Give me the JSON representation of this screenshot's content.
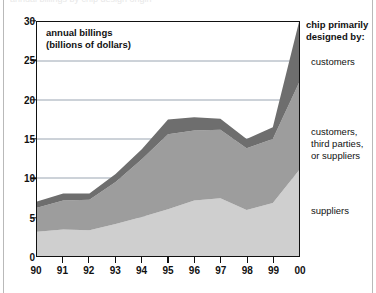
{
  "figure": {
    "clipped_title": "annual billings by chip design origin",
    "axis_caption_line1": "annual billings",
    "axis_caption_line2": "(billions of dollars)"
  },
  "legend": {
    "title_line1": "chip primarily",
    "title_line2": "designed by:",
    "entries": [
      {
        "key": "customers",
        "label": "customers",
        "color": "#6e6e6e"
      },
      {
        "key": "mixed",
        "label_line1": "customers,",
        "label_line2": "third parties,",
        "label_line3": "or suppliers",
        "color": "#9d9d9d"
      },
      {
        "key": "suppliers",
        "label": "suppliers",
        "color": "#cfcfcf"
      }
    ]
  },
  "chart_data": {
    "type": "area",
    "stacked": true,
    "title": "",
    "xlabel": "",
    "ylabel": "annual billings (billions of dollars)",
    "x": [
      "90",
      "91",
      "92",
      "93",
      "94",
      "95",
      "96",
      "97",
      "98",
      "99",
      "00"
    ],
    "xlim": [
      0,
      10
    ],
    "ylim": [
      0,
      30
    ],
    "yticks": [
      0,
      5,
      10,
      15,
      20,
      25,
      30
    ],
    "xticks": [
      "90",
      "91",
      "92",
      "93",
      "94",
      "95",
      "96",
      "97",
      "98",
      "99",
      "00"
    ],
    "grid": "horizontal",
    "legend_position": "right",
    "series": [
      {
        "name": "suppliers",
        "color": "#cfcfcf",
        "values": [
          3.1,
          3.4,
          3.3,
          4.1,
          5.0,
          6.0,
          7.1,
          7.4,
          5.9,
          6.8,
          11.0
        ]
      },
      {
        "name": "customers, third parties, or suppliers",
        "color": "#9d9d9d",
        "values": [
          3.1,
          3.7,
          3.9,
          5.4,
          7.4,
          9.6,
          9.0,
          8.8,
          7.9,
          8.2,
          11.2
        ]
      },
      {
        "name": "customers",
        "color": "#6e6e6e",
        "values": [
          0.8,
          0.9,
          0.8,
          1.0,
          1.3,
          1.9,
          1.7,
          1.4,
          1.2,
          1.5,
          7.8
        ]
      }
    ],
    "totals": [
      7.0,
      8.0,
      8.0,
      10.5,
      13.7,
      17.5,
      17.8,
      17.6,
      15.0,
      16.5,
      30.0
    ]
  },
  "colors": {
    "band_top": "#6e6e6e",
    "band_middle": "#9d9d9d",
    "band_bottom": "#cfcfcf",
    "gridline": "#8d9aa8",
    "axis": "#111111",
    "background": "#ffffff"
  }
}
